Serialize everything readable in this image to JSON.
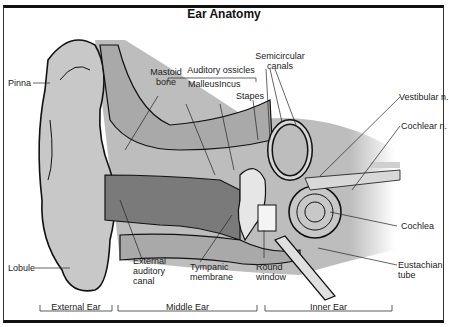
{
  "title": "Ear Anatomy",
  "labels": {
    "pinna": "Pinna",
    "lobule": "Lobule",
    "mastoid_bone_1": "Mastoid",
    "mastoid_bone_2": "bone",
    "auditory_ossicles": "Auditory ossicles",
    "malleus": "Malleus",
    "incus": "Incus",
    "stapes": "Stapes",
    "semicircular_1": "Semicircular",
    "semicircular_2": "canals",
    "vestibular_n": "Vestibular n.",
    "cochlear_n": "Cochlear n.",
    "cochlea": "Cochlea",
    "eustachian_1": "Eustachian",
    "eustachian_2": "tube",
    "external_canal_1": "External",
    "external_canal_2": "auditory",
    "external_canal_3": "canal",
    "tympanic_1": "Tympanic",
    "tympanic_2": "membrane",
    "round_1": "Round",
    "round_2": "window"
  },
  "sections": {
    "external": "External Ear",
    "middle": "Middle Ear",
    "inner": "Inner Ear"
  },
  "colors": {
    "tissue": "#c8c8c8",
    "bone": "#a9a9a9",
    "canal": "#7a7a7a",
    "outline": "#111111"
  }
}
